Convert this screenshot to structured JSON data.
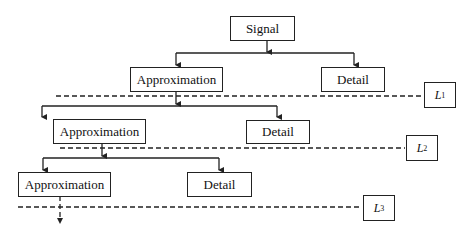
{
  "diagram": {
    "nodes": {
      "signal": "Signal",
      "level1": {
        "approximation": "Approximation",
        "detail": "Detail"
      },
      "level2": {
        "approximation": "Approximation",
        "detail": "Detail"
      },
      "level3": {
        "approximation": "Approximation",
        "detail": "Detail"
      }
    },
    "levels": [
      {
        "letter": "L",
        "index": "1"
      },
      {
        "letter": "L",
        "index": "2"
      },
      {
        "letter": "L",
        "index": "3"
      }
    ],
    "colors": {
      "line": "#222222",
      "background": "#ffffff"
    }
  }
}
